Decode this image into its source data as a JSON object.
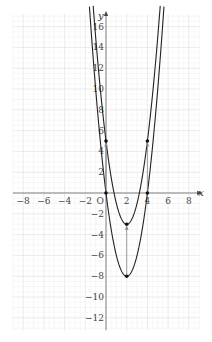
{
  "chart_data": {
    "type": "line",
    "title": "",
    "xlabel": "x",
    "ylabel": "y",
    "origin_label": "O",
    "xlim": [
      -9,
      9
    ],
    "ylim": [
      -13.2,
      17.2
    ],
    "grid": true,
    "x_ticks": [
      -8,
      -6,
      -4,
      -2,
      2,
      4,
      6,
      8
    ],
    "y_ticks": [
      -12,
      -10,
      -8,
      -6,
      -4,
      -2,
      2,
      4,
      6,
      8,
      10,
      12,
      14,
      16
    ],
    "series": [
      {
        "name": "y = 2x^2 - 8x",
        "formula": "2*(x-2)^2-8",
        "vertex": [
          2,
          -8
        ],
        "points": [
          [
            0,
            0
          ],
          [
            4,
            0
          ],
          [
            2,
            -8
          ]
        ],
        "color": "#222222"
      },
      {
        "name": "y = 2x^2 - 8x + 5",
        "formula": "2*(x-2)^2-3",
        "vertex": [
          2,
          -3
        ],
        "points": [
          [
            0,
            5
          ],
          [
            4,
            5
          ],
          [
            2,
            -3
          ]
        ],
        "color": "#222222"
      }
    ],
    "annotations": [
      {
        "type": "arrow",
        "from": [
          0,
          0
        ],
        "to": [
          0,
          5
        ]
      },
      {
        "type": "arrow",
        "from": [
          4,
          0
        ],
        "to": [
          4,
          5
        ]
      },
      {
        "type": "arrow",
        "from": [
          2,
          -8
        ],
        "to": [
          2,
          -3
        ]
      }
    ]
  },
  "colors": {
    "curve": "#222222",
    "arrow": "#888888",
    "grid_minor": "#f0f0f0",
    "grid_major": "#e2e2e2",
    "axis": "#777777"
  }
}
